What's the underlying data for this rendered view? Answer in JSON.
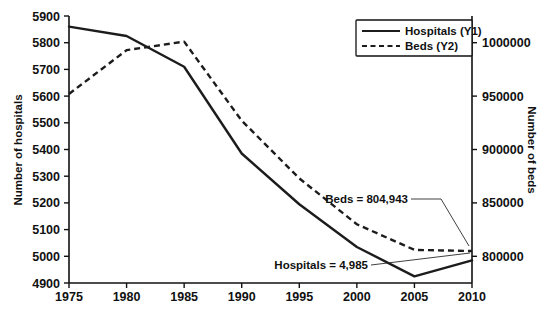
{
  "chart_data": {
    "type": "line",
    "title": "",
    "xlabel": "",
    "ylabel": "Number of hospitals",
    "y2label": "Number of beds",
    "x": [
      1975,
      1980,
      1985,
      1990,
      1995,
      2000,
      2005,
      2010
    ],
    "xticklabels": [
      "1975",
      "1980",
      "1985",
      "1990",
      "1995",
      "2000",
      "2005",
      "2010"
    ],
    "xlim": [
      1975,
      2010
    ],
    "ylim": [
      4900,
      5900
    ],
    "yticks": [
      4900,
      5000,
      5100,
      5200,
      5300,
      5400,
      5500,
      5600,
      5700,
      5800,
      5900
    ],
    "yticklabels": [
      "4900",
      "5000",
      "5100",
      "5200",
      "5300",
      "5400",
      "5500",
      "5600",
      "5700",
      "5800",
      "5900"
    ],
    "y2lim": [
      775000,
      1025000
    ],
    "y2ticks": [
      800000,
      850000,
      900000,
      950000,
      1000000
    ],
    "y2ticklabels": [
      "800000",
      "850000",
      "900000",
      "950000",
      "1000000"
    ],
    "grid": false,
    "legend_position": "top-right",
    "series": [
      {
        "name": "Hospitals (Y1)",
        "axis": "y1",
        "style": "solid",
        "values": [
          5860,
          5825,
          5710,
          5385,
          5195,
          5035,
          4925,
          4985
        ]
      },
      {
        "name": "Beds (Y2)",
        "axis": "y2",
        "style": "dashed",
        "values": [
          952000,
          993000,
          1001000,
          927000,
          873000,
          830000,
          806000,
          804943
        ]
      }
    ],
    "annotations": [
      {
        "text": "Beds = 804,943",
        "x": 2010,
        "value": 804943,
        "axis": "y2"
      },
      {
        "text": "Hospitals = 4,985",
        "x": 2010,
        "value": 4985,
        "axis": "y1"
      }
    ]
  },
  "legend": {
    "items": [
      {
        "label": "Hospitals (Y1)"
      },
      {
        "label": "Beds (Y2)"
      }
    ]
  },
  "axes": {
    "left_title": "Number of hospitals",
    "right_title": "Number of beds"
  },
  "annotations": {
    "beds": "Beds = 804,943",
    "hospitals": "Hospitals = 4,985"
  },
  "colors": {
    "ink": "#1c1c1c",
    "background": "#ffffff"
  }
}
